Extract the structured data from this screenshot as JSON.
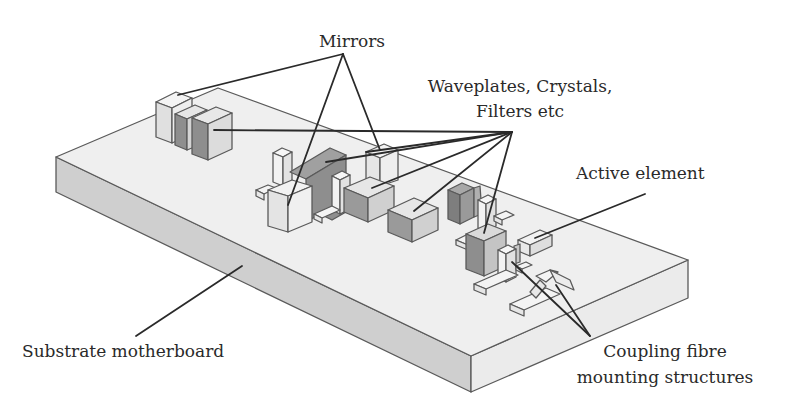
{
  "diagram": {
    "type": "isometric-schematic",
    "colors": {
      "background": "#ffffff",
      "board_top": "#efefef",
      "board_front_left": "#cfcfcf",
      "board_front_right": "#ebebeb",
      "component_light": "#ececec",
      "component_mid": "#cccccc",
      "component_dark": "#8e8e8e",
      "outline": "#5a5a5a",
      "leader_line": "#2a2a2a",
      "text": "#2a2a2a"
    },
    "labels": {
      "mirrors": "Mirrors",
      "waveplates_line1": "Waveplates, Crystals,",
      "waveplates_line2": "Filters etc",
      "active_element": "Active element",
      "substrate": "Substrate motherboard",
      "coupling_line1": "Coupling fibre",
      "coupling_line2": "mounting structures"
    }
  }
}
